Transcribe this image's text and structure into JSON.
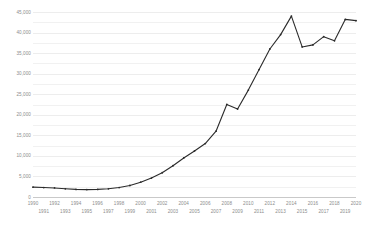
{
  "chart_data": {
    "type": "line",
    "title": "",
    "subtitle": "",
    "xlabel": "",
    "ylabel": "",
    "grid": true,
    "legend": null,
    "xlim": [
      1990,
      2020
    ],
    "ylim": [
      0,
      45000
    ],
    "y_ticks": [
      0,
      5000,
      10000,
      15000,
      20000,
      25000,
      30000,
      35000,
      40000,
      45000
    ],
    "y_tick_labels": [
      "0",
      "5,000",
      "10,000",
      "15,000",
      "20,000",
      "25,000",
      "30,000",
      "35,000",
      "40,000",
      "45,000"
    ],
    "y_minor_step": 2500,
    "x": [
      1990,
      1991,
      1992,
      1993,
      1994,
      1995,
      1996,
      1997,
      1998,
      1999,
      2000,
      2001,
      2002,
      2003,
      2004,
      2005,
      2006,
      2007,
      2008,
      2009,
      2010,
      2011,
      2012,
      2013,
      2014,
      2015,
      2016,
      2017,
      2018,
      2019,
      2020
    ],
    "x_tick_labels": [
      "1990",
      "1991",
      "1992",
      "1993",
      "1994",
      "1995",
      "1996",
      "1997",
      "1998",
      "1999",
      "2000",
      "2001",
      "2002",
      "2003",
      "2004",
      "2005",
      "2006",
      "2007",
      "2008",
      "2009",
      "2010",
      "2011",
      "2012",
      "2013",
      "2014",
      "2015",
      "2016",
      "2017",
      "2018",
      "2019",
      "2020"
    ],
    "series": [
      {
        "name": "series-1",
        "color": "#2b2b2b",
        "values": [
          2400,
          2300,
          2200,
          2000,
          1850,
          1800,
          1850,
          2000,
          2300,
          2800,
          3600,
          4600,
          5900,
          7600,
          9500,
          11200,
          13000,
          16000,
          22500,
          21400,
          26000,
          31000,
          36000,
          39500,
          44000,
          36500,
          37000,
          39000,
          38000,
          43200,
          42900
        ]
      }
    ],
    "colors": {
      "line": "#2b2b2b",
      "grid": "#f1f1f1",
      "grid_major": "#ededed",
      "axis": "#c9c9c9",
      "tick_text": "#8c8c8c",
      "background": "#ffffff"
    }
  }
}
